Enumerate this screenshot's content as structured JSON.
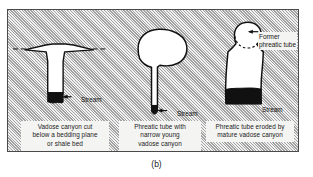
{
  "figure": {
    "label": "(b)",
    "frame": {
      "border_color": "#4a4a4a",
      "fill_color": "#c9c9c9",
      "hatch_color": "#828282"
    }
  },
  "colors": {
    "rock_hatch": "#c9c9c9",
    "passage_fill": "#ffffff",
    "passage_outline": "#111111",
    "stream_fill": "#111111",
    "caption_background": "#f4f4f2",
    "text": "#1b1b1b"
  },
  "diagrams": [
    {
      "id": "vadose-canyon",
      "name": "vadose-canyon-cut-below-bedding-plane",
      "caption_lines": [
        "Vadose canyon cut",
        "below a bedding plane",
        "or shale bed"
      ],
      "features": [
        {
          "name": "bedding-plane-dashed-line"
        },
        {
          "name": "vadose-canyon-passage"
        },
        {
          "name": "stream-deposit"
        }
      ],
      "annotation": {
        "name": "stream-label",
        "text": "Stream"
      }
    },
    {
      "id": "phreatic-tube-young",
      "name": "phreatic-tube-with-narrow-young-vadose-canyon",
      "caption_lines": [
        "Phreatic tube with",
        "narrow young",
        "vadose canyon"
      ],
      "features": [
        {
          "name": "phreatic-tube-passage"
        },
        {
          "name": "narrow-vadose-canyon"
        },
        {
          "name": "stream-deposit"
        }
      ],
      "annotation": {
        "name": "stream-label",
        "text": "Stream"
      }
    },
    {
      "id": "phreatic-tube-mature",
      "name": "phreatic-tube-eroded-by-mature-vadose-canyon",
      "caption_lines": [
        "Phreatic tube eroded by",
        "mature vadose canyon"
      ],
      "features": [
        {
          "name": "former-phreatic-tube-circle"
        },
        {
          "name": "former-phreatic-tube-dashed-arc"
        },
        {
          "name": "mature-vadose-canyon-passage"
        },
        {
          "name": "stream-deposit"
        }
      ],
      "annotations": [
        {
          "name": "former-phreatic-tube-label",
          "lines": [
            "Former",
            "phreatic tube"
          ]
        },
        {
          "name": "stream-label",
          "text": "Stream"
        }
      ]
    }
  ]
}
